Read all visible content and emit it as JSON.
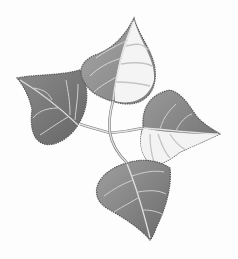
{
  "image": {
    "description": "Grayscale illustration of four heart-shaped poplar leaves with serrated edges arranged in a pinwheel around a central branching stem",
    "background": "#fdfdfd",
    "colors": {
      "leaf_dark": "#6e6e6e",
      "leaf_mid": "#8e8e8e",
      "leaf_light": "#b9b9b9",
      "leaf_pale": "#f4f4f4",
      "outline": "#5a5a5a",
      "vein": "#e6e6e6",
      "stem": "#d8d8d8"
    },
    "leaves": [
      {
        "name": "top-leaf",
        "position": "top",
        "tip_direction": "up"
      },
      {
        "name": "left-leaf",
        "position": "left",
        "tip_direction": "upper-left"
      },
      {
        "name": "right-leaf",
        "position": "right",
        "tip_direction": "right"
      },
      {
        "name": "bottom-leaf",
        "position": "bottom",
        "tip_direction": "down"
      }
    ]
  }
}
